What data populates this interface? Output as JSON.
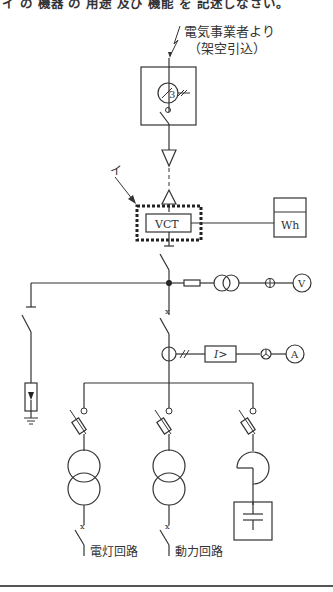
{
  "question": {
    "top_text_partial": "イ の 機器 の 用途 及び 機能 を 記述しなさい。"
  },
  "diagram": {
    "supply_label_line1": "電気事業者より",
    "supply_label_line2": "（架空引込）",
    "pas_ct_label": "3",
    "pointer_label": "イ",
    "vct_label": "VCT",
    "wh_label": "Wh",
    "voltmeter_label": "V",
    "ammeter_label": "A",
    "ocr_label": "I>",
    "circuit_lighting_label": "電灯回路",
    "circuit_power_label": "動力回路"
  }
}
